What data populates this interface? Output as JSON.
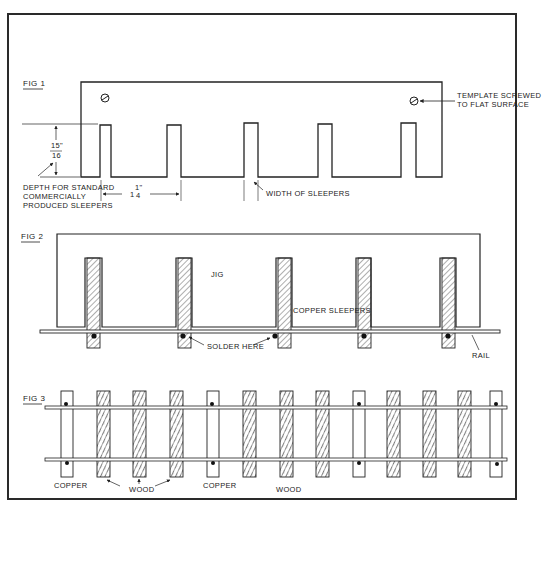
{
  "figures": {
    "fig1": {
      "title": "FIG 1",
      "labels": {
        "template": [
          "TEMPLATE SCREWED",
          "TO FLAT SURFACE"
        ],
        "depth_num": "15\"",
        "depth_den": "16",
        "depth_note": [
          "DEPTH FOR STANDARD",
          "COMMERCIALLY",
          "PRODUCED SLEEPERS"
        ],
        "spacing_whole": "1",
        "spacing_num": "1\"",
        "spacing_den": "4",
        "width": "WIDTH OF SLEEPERS"
      }
    },
    "fig2": {
      "title": "FIG 2",
      "labels": {
        "jig": "JIG",
        "copper": "COPPER SLEEPERS",
        "solder": "SOLDER HERE",
        "rail": "RAIL"
      }
    },
    "fig3": {
      "title": "FIG 3",
      "labels": {
        "copper1": "COPPER",
        "wood1": "WOOD",
        "copper2": "COPPER",
        "wood2": "WOOD"
      }
    }
  },
  "colors": {
    "ink": "#222222",
    "paper": "#ffffff"
  }
}
